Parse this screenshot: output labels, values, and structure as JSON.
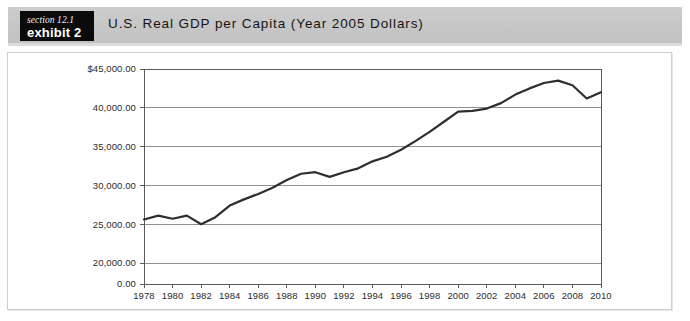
{
  "header": {
    "section_label": "section 12.1",
    "exhibit_label": "exhibit 2",
    "title": "U.S. Real GDP per Capita (Year 2005 Dollars)",
    "band_color": "#c6c6c6",
    "tag_color": "#0b0b0b"
  },
  "chart_data": {
    "type": "line",
    "title": "U.S. Real GDP per Capita (Year 2005 Dollars)",
    "xlabel": "",
    "ylabel": "",
    "grid": true,
    "legend": "none",
    "line_color": "#2e2e2e",
    "xlim": [
      1978,
      2010
    ],
    "ylim": [
      20000,
      45000
    ],
    "y_axis_note": "axis broken between 0.00 and 20,000.00",
    "ytick_labels": [
      "$45,000.00",
      "40,000.00",
      "35,000.00",
      "30,000.00",
      "25,000.00",
      "20,000.00",
      "0.00"
    ],
    "yticks": [
      45000,
      40000,
      35000,
      30000,
      25000,
      20000,
      0
    ],
    "xtick_labels": [
      "1978",
      "1980",
      "1982",
      "1984",
      "1986",
      "1988",
      "1990",
      "1992",
      "1994",
      "1996",
      "1998",
      "2000",
      "2002",
      "2004",
      "2006",
      "2008",
      "2010"
    ],
    "xticks": [
      1978,
      1980,
      1982,
      1984,
      1986,
      1988,
      1990,
      1992,
      1994,
      1996,
      1998,
      2000,
      2002,
      2004,
      2006,
      2008,
      2010
    ],
    "x": [
      1978,
      1979,
      1980,
      1981,
      1982,
      1983,
      1984,
      1985,
      1986,
      1987,
      1988,
      1989,
      1990,
      1991,
      1992,
      1993,
      1994,
      1995,
      1996,
      1997,
      1998,
      1999,
      2000,
      2001,
      2002,
      2003,
      2004,
      2005,
      2006,
      2007,
      2008,
      2009,
      2010
    ],
    "values": [
      25600,
      26100,
      25700,
      26100,
      25000,
      25900,
      27400,
      28200,
      28900,
      29700,
      30700,
      31500,
      31700,
      31100,
      31700,
      32200,
      33100,
      33700,
      34600,
      35700,
      36900,
      38200,
      39500,
      39600,
      39900,
      40600,
      41700,
      42500,
      43200,
      43500,
      42900,
      41200,
      42000
    ]
  }
}
